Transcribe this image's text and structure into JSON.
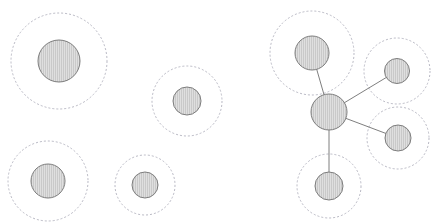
{
  "figure": {
    "width": 442,
    "height": 223,
    "background_color": "#ffffff"
  },
  "style": {
    "node_fill_color": "#c9c9c9",
    "node_hatch_color": "#ffffff",
    "node_hatch_pattern": "vertical-lines",
    "node_stroke_color": "#7d7d7d",
    "node_stroke_width": 1,
    "halo_stroke_color": "#b9b9c4",
    "halo_stroke_width": 1,
    "halo_dash_pattern": "2 2",
    "halo_fill": "none",
    "edge_stroke_color": "#6f6f6f",
    "edge_stroke_width": 0.9
  },
  "chart_data": {
    "type": "scatter",
    "xlabel": "",
    "ylabel": "",
    "xlim": [
      0,
      442
    ],
    "ylim": [
      0,
      223
    ],
    "grid": false,
    "legend": "none",
    "groups": [
      {
        "name": "isolated-nodes",
        "label": "Isolated nodes",
        "connected": false,
        "nodes": [
          {
            "id": "n1",
            "label": "isolated-node-1",
            "x": 59,
            "y": 61,
            "r": 21,
            "halo_r": 48
          },
          {
            "id": "n2",
            "label": "isolated-node-2",
            "x": 187,
            "y": 101,
            "r": 14,
            "halo_r": 35
          },
          {
            "id": "n3",
            "label": "isolated-node-3",
            "x": 48,
            "y": 181,
            "r": 17,
            "halo_r": 40
          },
          {
            "id": "n4",
            "label": "isolated-node-4",
            "x": 145,
            "y": 185,
            "r": 13,
            "halo_r": 30
          }
        ],
        "edges": []
      },
      {
        "name": "star-cluster",
        "label": "Connected star cluster",
        "connected": true,
        "nodes": [
          {
            "id": "hub",
            "label": "cluster-hub-node",
            "x": 329,
            "y": 112,
            "r": 18,
            "halo_r": 0
          },
          {
            "id": "s1",
            "label": "cluster-node-top",
            "x": 312,
            "y": 53,
            "r": 17,
            "halo_r": 42
          },
          {
            "id": "s2",
            "label": "cluster-node-upper-right",
            "x": 397,
            "y": 71,
            "r": 12.5,
            "halo_r": 33
          },
          {
            "id": "s3",
            "label": "cluster-node-lower-right",
            "x": 398,
            "y": 138,
            "r": 13,
            "halo_r": 31
          },
          {
            "id": "s4",
            "label": "cluster-node-bottom",
            "x": 329,
            "y": 186,
            "r": 14,
            "halo_r": 32
          }
        ],
        "edges": [
          {
            "id": "e1",
            "label": "edge-hub-top",
            "source": "hub",
            "target": "s1"
          },
          {
            "id": "e2",
            "label": "edge-hub-upper-right",
            "source": "hub",
            "target": "s2"
          },
          {
            "id": "e3",
            "label": "edge-hub-lower-right",
            "source": "hub",
            "target": "s3"
          },
          {
            "id": "e4",
            "label": "edge-hub-bottom",
            "source": "hub",
            "target": "s4"
          }
        ]
      }
    ]
  }
}
